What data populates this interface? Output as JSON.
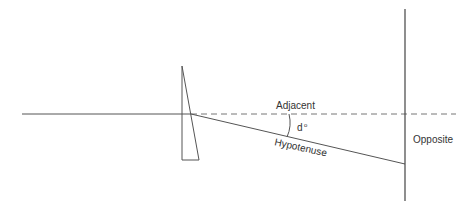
{
  "diagram": {
    "type": "prism-refraction-trigonometry",
    "labels": {
      "adjacent": "Adjacent",
      "angle": "d",
      "angle_unit": "o",
      "hypotenuse": "Hypotenuse",
      "opposite": "Opposite"
    },
    "colors": {
      "line": "#555555",
      "dashed": "#777777",
      "text": "#333333",
      "background": "#ffffff"
    }
  }
}
